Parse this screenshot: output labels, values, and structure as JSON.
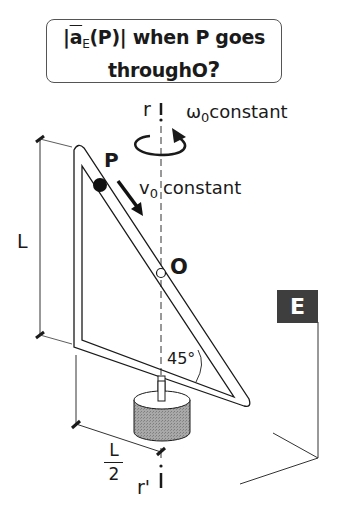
{
  "question": {
    "prefix": "|",
    "vector_symbol": "a",
    "vector_subscript": "E",
    "argument": "(P)|",
    "text_line1_rest": " when P goes",
    "text_line2": "through O?",
    "line2_main": "through",
    "line2_point": "O",
    "line2_q": "?"
  },
  "labels": {
    "axis_top": "r",
    "axis_bottom": "r'",
    "omega_symbol": "ω",
    "omega_subscript": "0",
    "omega_text": "constant",
    "velocity_symbol": "v",
    "velocity_subscript": "0",
    "velocity_text": "constant",
    "point_p": "P",
    "point_o": "O",
    "length_l": "L",
    "half_num": "L",
    "half_den": "2",
    "angle": "45°",
    "frame": "E"
  },
  "colors": {
    "ink": "#1a1a1a",
    "frame_box": "#3e3e3e",
    "cylinder": "#9a9a9a"
  }
}
